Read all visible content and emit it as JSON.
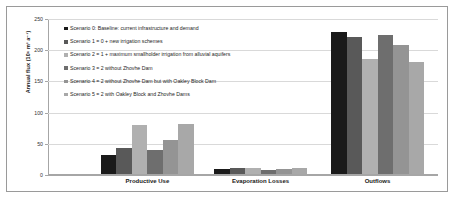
{
  "chart_data": {
    "type": "bar",
    "title": "",
    "xlabel": "",
    "ylabel": "Annual flux (10⁶ m³ a⁻¹)",
    "ylim": [
      0,
      250
    ],
    "ytick_labels": [
      "0",
      "50",
      "100",
      "150",
      "200",
      "250"
    ],
    "ytick_values": [
      0,
      50,
      100,
      150,
      200,
      250
    ],
    "grid": true,
    "legend_position": "upper-center",
    "categories": [
      "Productive Use",
      "Evaporation Losses",
      "Outflows"
    ],
    "series": [
      {
        "name": "Scenario 0: Baseline: current infrastructure and demand",
        "color": "#1a1a1a",
        "values": [
          30,
          8,
          228
        ]
      },
      {
        "name": "Scenario 1 = 0 + new irrigation schemes",
        "color": "#595959",
        "values": [
          42,
          9,
          220
        ]
      },
      {
        "name": "Scenario 2 = 1 + maximum smallholder irrigation from alluvial aquifers",
        "color": "#b0b0b0",
        "values": [
          78,
          10,
          185
        ]
      },
      {
        "name": "Scenario 3 = 2 without Zhovhe Dam",
        "color": "#6e6e6e",
        "values": [
          38,
          7,
          222
        ]
      },
      {
        "name": "Scenario 4 = 2 without Zhovhe Dam but with Oakley Block Dam",
        "color": "#949494",
        "values": [
          55,
          8,
          207
        ]
      },
      {
        "name": "Scenario 5 = 2 with Oakley Block and Zhovhe Dams",
        "color": "#a8a8a8",
        "values": [
          80,
          10,
          180
        ]
      }
    ]
  }
}
